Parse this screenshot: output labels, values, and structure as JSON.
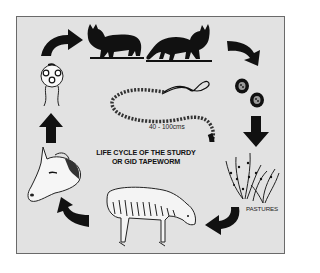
{
  "diagram": {
    "title_line1": "LIFE CYCLE OF THE STURDY",
    "title_line2": "OR GID TAPEWORM",
    "tapeworm_length_label": "40 - 100cms",
    "pastures_label": "PASTURES",
    "stages": [
      {
        "id": "dog",
        "icon": "dog-silhouette-icon"
      },
      {
        "id": "fox",
        "icon": "fox-silhouette-icon"
      },
      {
        "id": "eggs",
        "icon": "tapeworm-eggs-icon"
      },
      {
        "id": "pastures",
        "icon": "pasture-grass-icon",
        "label": "PASTURES"
      },
      {
        "id": "grazing-sheep",
        "icon": "grazing-sheep-icon"
      },
      {
        "id": "infected-sheep-head",
        "icon": "sheep-head-icon"
      },
      {
        "id": "cyst",
        "icon": "coenurus-cyst-icon"
      }
    ],
    "colors": {
      "background": "#e2e2e2",
      "border": "#6a6a6a",
      "ink": "#111111"
    }
  }
}
